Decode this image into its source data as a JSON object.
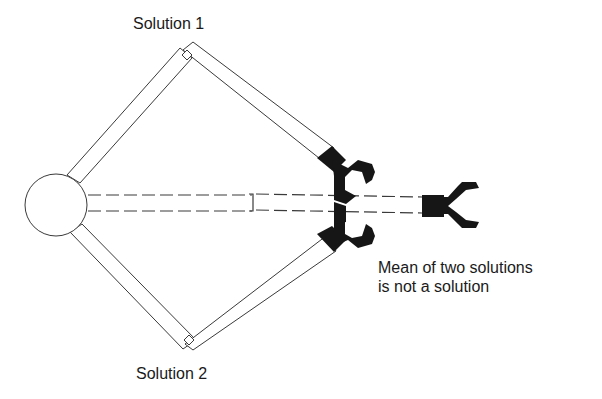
{
  "diagram": {
    "labels": {
      "solution_1": "Solution 1",
      "solution_2": "Solution 2",
      "mean_line_1": "Mean of two solutions",
      "mean_line_2": "is not a solution"
    },
    "colors": {
      "line": "#3a3a3a",
      "gripper": "#161616",
      "background": "#ffffff"
    },
    "geometry": {
      "base": {
        "cx": 56,
        "cy": 205,
        "r": 31
      },
      "solution_1": {
        "elbow": [
          187,
          55
        ],
        "gripper": [
          330,
          165
        ]
      },
      "solution_2": {
        "elbow": [
          189,
          340
        ],
        "gripper": [
          330,
          238
        ]
      },
      "mean": {
        "joint": [
          252,
          205
        ],
        "gripper": [
          433,
          205
        ]
      }
    }
  }
}
